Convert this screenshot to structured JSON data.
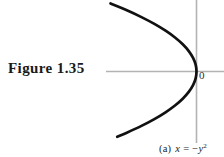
{
  "figure": {
    "label": "Figure 1.35",
    "origin_label": "0",
    "caption": {
      "tag": "(a)",
      "lhs": "x",
      "equals": "=",
      "sign": "−",
      "variable": "y",
      "exponent": "2",
      "full_text": "(a) x = −y²"
    }
  },
  "chart_data": {
    "type": "line",
    "title": "",
    "subtitle": "",
    "xlabel": "",
    "ylabel": "",
    "equation": "x = -y^2",
    "grid": false,
    "legend": false,
    "axis_color": "#b3b3b3",
    "curve_color": "#111111",
    "background": "#ffffff",
    "origin_px": {
      "x": 196,
      "y": 71
    },
    "x_axis_px": {
      "y": 71,
      "x_start": 106,
      "x_end": 224
    },
    "y_axis_px": {
      "x": 196,
      "y_start": 0,
      "y_end": 143
    },
    "px_per_unit": {
      "x": 86,
      "y": 68
    },
    "xlim": [
      -1.05,
      0.33
    ],
    "ylim": [
      -1.06,
      1.05
    ],
    "series": [
      {
        "name": "x = -y^2",
        "y": [
          1.0,
          0.9,
          0.8,
          0.7,
          0.6,
          0.5,
          0.4,
          0.3,
          0.2,
          0.1,
          0.0,
          -0.1,
          -0.2,
          -0.3,
          -0.4,
          -0.5,
          -0.6,
          -0.7,
          -0.8,
          -0.9,
          -0.96
        ],
        "x": [
          -1.0,
          -0.81,
          -0.64,
          -0.49,
          -0.36,
          -0.25,
          -0.16,
          -0.09,
          -0.04,
          -0.01,
          0.0,
          -0.01,
          -0.04,
          -0.09,
          -0.16,
          -0.25,
          -0.36,
          -0.49,
          -0.64,
          -0.81,
          -0.922
        ]
      }
    ],
    "annotations": [
      {
        "text": "0",
        "x_px": 201,
        "y_px": 77,
        "role": "origin-label"
      }
    ]
  }
}
